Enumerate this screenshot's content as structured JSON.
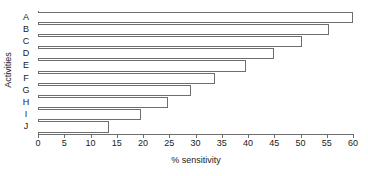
{
  "chart_data": {
    "type": "bar",
    "orientation": "horizontal",
    "title": "",
    "xlabel": "% sensitivity",
    "ylabel": "Activities",
    "categories": [
      "A",
      "B",
      "C",
      "D",
      "E",
      "F",
      "G",
      "H",
      "I",
      "J"
    ],
    "values": [
      60,
      55.5,
      50.3,
      45,
      39.7,
      33.7,
      29.2,
      24.8,
      19.7,
      13.5
    ],
    "series": [
      {
        "name": "% sensitivity",
        "values": [
          60,
          55.5,
          50.3,
          45,
          39.7,
          33.7,
          29.2,
          24.8,
          19.7,
          13.5
        ]
      }
    ],
    "xlim": [
      0,
      60
    ],
    "xticks": [
      0,
      5,
      10,
      15,
      20,
      25,
      30,
      35,
      40,
      45,
      50,
      55,
      60
    ],
    "xtick_labels": [
      "0",
      "5",
      "10",
      "15",
      "20",
      "25",
      "30",
      "35",
      "40",
      "45",
      "50",
      "55",
      "60"
    ],
    "grid": false,
    "legend": false,
    "bar_fill_color": "#ffffff",
    "bar_edge_color": "#6e6e6e",
    "axis_color": "#6e6e6e",
    "text_color": "#1a1a1a"
  }
}
